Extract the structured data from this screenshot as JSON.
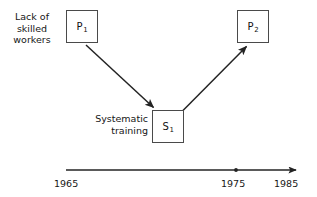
{
  "diagram": {
    "type": "timeline-causal-diagram",
    "background_color": "#ffffff",
    "line_color": "#232323",
    "box_border_color": "#4a4a4a",
    "text_color": "#161616",
    "nodes": [
      {
        "id": "P1",
        "symbol": "P",
        "subscript": "1",
        "x": 66,
        "y": 10,
        "w": 32,
        "h": 33,
        "annotation": "Lack of\nskilled\nworkers",
        "annotation_position": "left"
      },
      {
        "id": "S1",
        "symbol": "S",
        "subscript": "1",
        "x": 152,
        "y": 110,
        "w": 32,
        "h": 33,
        "annotation": "Systematic\ntraining",
        "annotation_position": "left"
      },
      {
        "id": "P2",
        "symbol": "P",
        "subscript": "2",
        "x": 237,
        "y": 10,
        "w": 32,
        "h": 33,
        "annotation": "",
        "annotation_position": "none"
      }
    ],
    "arrows": [
      {
        "id": "p1-to-s1",
        "from": "P1",
        "to": "S1",
        "x1": 86,
        "y1": 45,
        "x2": 154,
        "y2": 108
      },
      {
        "id": "s1-to-p2",
        "from": "S1",
        "to": "P2",
        "x1": 183,
        "y1": 110,
        "x2": 247,
        "y2": 46
      }
    ],
    "timeline": {
      "id": "time-axis",
      "x_start": 66,
      "x_end": 297,
      "y": 170,
      "arrowhead": "right",
      "ticks": [
        {
          "label": "1965",
          "x": 66,
          "marker": "none"
        },
        {
          "label": "1975",
          "x": 236,
          "marker": "dot"
        },
        {
          "label": "1985",
          "x": 293,
          "marker": "arrow-end"
        }
      ]
    }
  },
  "labels": {
    "lack_of_skilled_workers": "Lack of\nskilled\nworkers",
    "systematic_training": "Systematic\ntraining",
    "node_p1_symbol": "P",
    "node_p1_subscript": "1",
    "node_p2_symbol": "P",
    "node_p2_subscript": "2",
    "node_s1_symbol": "S",
    "node_s1_subscript": "1",
    "tick_1965": "1965",
    "tick_1975": "1975",
    "tick_1985": "1985"
  }
}
